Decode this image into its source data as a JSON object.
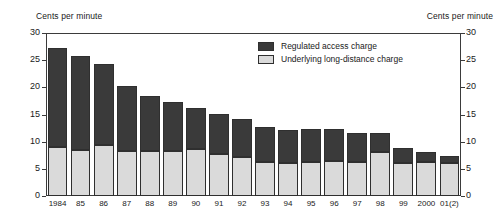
{
  "chart_data": {
    "type": "bar",
    "stacked": true,
    "title": "",
    "xlabel": "",
    "ylabel": "Cents per minute",
    "ylabel_right": "Cents per minute",
    "ylim": [
      0,
      30
    ],
    "yticks": [
      0,
      5,
      10,
      15,
      20,
      25,
      30
    ],
    "grid": false,
    "legend_position": "top-right",
    "categories": [
      "1984",
      "85",
      "86",
      "87",
      "88",
      "89",
      "90",
      "91",
      "92",
      "93",
      "94",
      "95",
      "96",
      "97",
      "98",
      "99",
      "2000",
      "01(2)"
    ],
    "series": [
      {
        "name": "Underlying long-distance charge",
        "color": "#dadada",
        "values": [
          9.0,
          8.5,
          9.4,
          8.3,
          8.3,
          8.3,
          8.7,
          7.8,
          7.2,
          6.3,
          6.0,
          6.3,
          6.5,
          6.3,
          8.1,
          6.1,
          6.2,
          6.1
        ]
      },
      {
        "name": "Regulated access charge",
        "color": "#3a3a3a",
        "values": [
          18.0,
          17.1,
          14.8,
          11.8,
          10.0,
          8.9,
          7.4,
          7.2,
          6.8,
          6.2,
          6.0,
          5.9,
          5.7,
          5.1,
          3.3,
          2.6,
          1.7,
          1.1
        ]
      }
    ],
    "totals": [
      27.0,
      25.6,
      24.2,
      20.1,
      18.3,
      17.2,
      16.1,
      15.0,
      14.0,
      12.5,
      12.0,
      12.2,
      12.2,
      11.4,
      11.4,
      8.7,
      7.9,
      7.2
    ]
  },
  "legend": {
    "items": [
      {
        "label": "Regulated access charge",
        "swatch": "dark"
      },
      {
        "label": "Underlying long-distance charge",
        "swatch": "light"
      }
    ]
  },
  "axes": {
    "left_title": "Cents per minute",
    "right_title": "Cents per minute"
  }
}
